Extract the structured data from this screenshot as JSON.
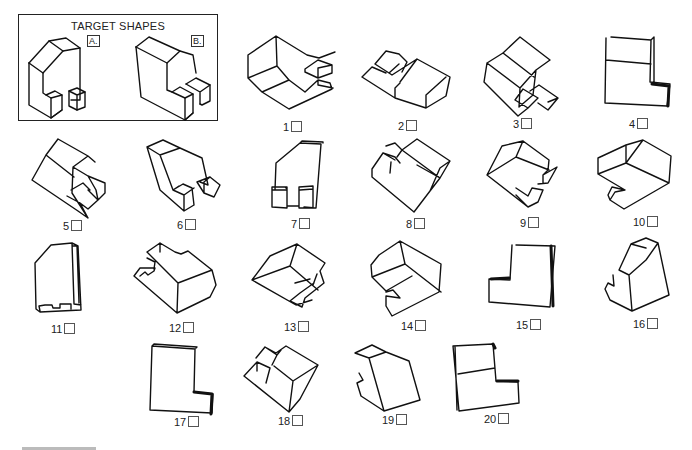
{
  "target_panel": {
    "title": "TARGET SHAPES",
    "shapes": [
      {
        "id": "A",
        "label": "A."
      },
      {
        "id": "B",
        "label": "B."
      }
    ]
  },
  "options": [
    {
      "number": "1",
      "checked": false
    },
    {
      "number": "2",
      "checked": false
    },
    {
      "number": "3",
      "checked": false
    },
    {
      "number": "4",
      "checked": false
    },
    {
      "number": "5",
      "checked": false
    },
    {
      "number": "6",
      "checked": false
    },
    {
      "number": "7",
      "checked": false
    },
    {
      "number": "8",
      "checked": false
    },
    {
      "number": "9",
      "checked": false
    },
    {
      "number": "10",
      "checked": false
    },
    {
      "number": "11",
      "checked": false
    },
    {
      "number": "12",
      "checked": false
    },
    {
      "number": "13",
      "checked": false
    },
    {
      "number": "14",
      "checked": false
    },
    {
      "number": "15",
      "checked": false
    },
    {
      "number": "16",
      "checked": false
    },
    {
      "number": "17",
      "checked": false
    },
    {
      "number": "18",
      "checked": false
    },
    {
      "number": "19",
      "checked": false
    },
    {
      "number": "20",
      "checked": false
    }
  ]
}
